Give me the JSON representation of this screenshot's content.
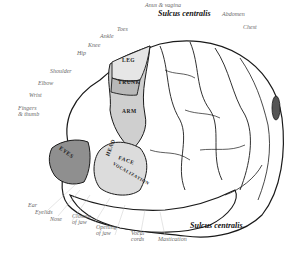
{
  "figure": {
    "sulcus_label_top": "Sulcus centralis",
    "sulcus_label_bottom": "Sulcus centralis.",
    "body_labels": {
      "anus_vagina": "Anus & vagina",
      "toes": "Toes",
      "ankle": "Ankle",
      "knee": "Knee",
      "hip": "Hip",
      "abdomen": "Abdomen",
      "chest": "Chest",
      "shoulder": "Shoulder",
      "elbow": "Elbow",
      "wrist": "Wrist",
      "fingers_thumb": "Fingers\n& thumb",
      "ear": "Ear",
      "eyelids": "Eyelids",
      "nose": "Nose",
      "closure_jaw": "Closure\nof jaw",
      "opening_jaw": "Opening\nof jaw",
      "vocal_cords": "Vocal\ncords",
      "mastication": "Mastication"
    },
    "region_labels": {
      "leg": "LEG",
      "trunk": "TRUNK",
      "arm": "ARM",
      "face": "FACE",
      "eyes": "EYES",
      "head": "HEAD",
      "vocalization": "VOCALIZATION"
    },
    "colors": {
      "ink": "#1a1a1a",
      "shade": "#9a9a9a",
      "label": "#555555",
      "background": "#ffffff"
    }
  }
}
